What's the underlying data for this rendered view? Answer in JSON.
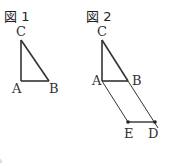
{
  "figure1": {
    "title": "図 1",
    "labels": {
      "A": "A",
      "B": "B",
      "C": "C"
    }
  },
  "figure2": {
    "title": "図 2",
    "labels": {
      "A": "A",
      "B": "B",
      "C": "C",
      "D": "D",
      "E": "E"
    }
  },
  "footnote": "。",
  "colors": {
    "line": "#333333",
    "text": "#333333"
  }
}
